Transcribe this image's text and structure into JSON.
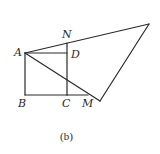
{
  "figure": {
    "caption": "(b)",
    "stroke_color": "#2a2a2a",
    "points": {
      "A": {
        "label": "A"
      },
      "B": {
        "label": "B"
      },
      "C": {
        "label": "C"
      },
      "D": {
        "label": "D"
      },
      "N": {
        "label": "N"
      },
      "M": {
        "label": "M"
      }
    }
  }
}
